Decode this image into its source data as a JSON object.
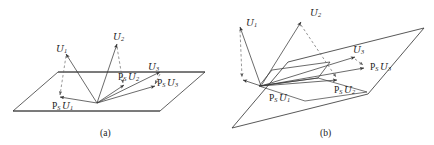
{
  "figure": {
    "background_color": "#ffffff",
    "line_color": "#3a3a3a",
    "dash_color": "#6b6b6b",
    "text_color": "#1a1a1a",
    "panels": [
      {
        "caption": "(a)",
        "vectors": [
          {
            "name": "U1",
            "base": "U",
            "sub": "1"
          },
          {
            "name": "U2",
            "base": "U",
            "sub": "2"
          },
          {
            "name": "U3",
            "base": "U",
            "sub": "3"
          }
        ],
        "projections": [
          {
            "name": "PsU1",
            "op": "P",
            "opsub": "S",
            "base": "U",
            "sub": "1"
          },
          {
            "name": "PsU2",
            "op": "P",
            "opsub": "S",
            "base": "U",
            "sub": "2"
          },
          {
            "name": "PsU3",
            "op": "P",
            "opsub": "S",
            "base": "U",
            "sub": "3"
          }
        ]
      },
      {
        "caption": "(b)",
        "vectors": [
          {
            "name": "U1",
            "base": "U",
            "sub": "1"
          },
          {
            "name": "U2",
            "base": "U",
            "sub": "2"
          },
          {
            "name": "U3",
            "base": "U",
            "sub": "3"
          }
        ],
        "projections": [
          {
            "name": "PsU1",
            "op": "P",
            "opsub": "S",
            "base": "U",
            "sub": "1"
          },
          {
            "name": "PsU2",
            "op": "P",
            "opsub": "S",
            "base": "U",
            "sub": "2"
          },
          {
            "name": "PsU3",
            "op": "P",
            "opsub": "S",
            "base": "U",
            "sub": "3"
          }
        ]
      }
    ],
    "labels": {
      "a_u1": "U",
      "a_u1_sub": "1",
      "a_u2": "U",
      "a_u2_sub": "2",
      "a_u3": "U",
      "a_u3_sub": "3",
      "a_p": "P",
      "a_p_sub": "S",
      "b_u1": "U",
      "b_u1_sub": "1",
      "b_u2": "U",
      "b_u2_sub": "2",
      "b_u3": "U",
      "b_u3_sub": "3",
      "b_p": "P",
      "b_p_sub": "S",
      "caption_a": "(a)",
      "caption_b": "(b)"
    }
  }
}
